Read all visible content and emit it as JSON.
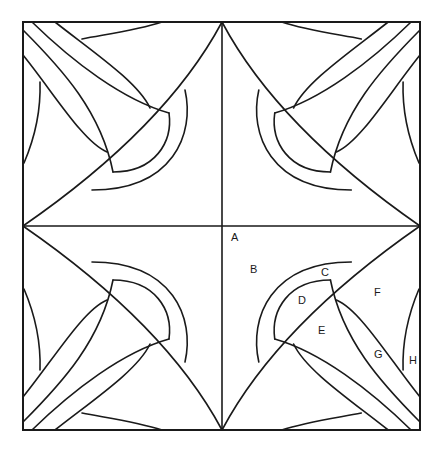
{
  "diagram": {
    "type": "quilt-block-pattern",
    "quadrants": 4,
    "colors": {
      "line": "#1a1a1a",
      "background": "#ffffff"
    },
    "labels": [
      {
        "id": "A",
        "text": "A",
        "x": 231,
        "y": 241
      },
      {
        "id": "B",
        "text": "B",
        "x": 250,
        "y": 273
      },
      {
        "id": "C",
        "text": "C",
        "x": 321,
        "y": 276
      },
      {
        "id": "D",
        "text": "D",
        "x": 298,
        "y": 304
      },
      {
        "id": "E",
        "text": "E",
        "x": 318,
        "y": 334
      },
      {
        "id": "F",
        "text": "F",
        "x": 374,
        "y": 296
      },
      {
        "id": "G",
        "text": "G",
        "x": 374,
        "y": 358
      },
      {
        "id": "H",
        "text": "H",
        "x": 409,
        "y": 364
      }
    ]
  }
}
